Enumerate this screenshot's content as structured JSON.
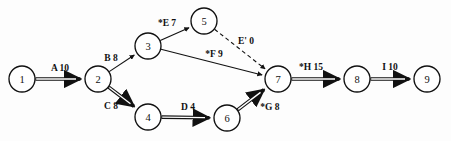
{
  "diagram": {
    "type": "activity-on-arrow-network",
    "title": "",
    "background_color": "#fdfdfd",
    "ink_color": "#111111",
    "nodes": [
      {
        "id": "1",
        "label": "1",
        "cx": 22,
        "cy": 79,
        "r": 13
      },
      {
        "id": "2",
        "label": "2",
        "cx": 98,
        "cy": 79,
        "r": 13
      },
      {
        "id": "3",
        "label": "3",
        "cx": 148,
        "cy": 46,
        "r": 13
      },
      {
        "id": "4",
        "label": "4",
        "cx": 148,
        "cy": 117,
        "r": 13
      },
      {
        "id": "5",
        "label": "5",
        "cx": 204,
        "cy": 21,
        "r": 13
      },
      {
        "id": "6",
        "label": "6",
        "cx": 227,
        "cy": 118,
        "r": 13
      },
      {
        "id": "7",
        "label": "7",
        "cx": 278,
        "cy": 79,
        "r": 13
      },
      {
        "id": "8",
        "label": "8",
        "cx": 357,
        "cy": 79,
        "r": 13
      },
      {
        "id": "9",
        "label": "9",
        "cx": 427,
        "cy": 79,
        "r": 13
      }
    ],
    "edges": [
      {
        "id": "A",
        "from": "1",
        "to": "2",
        "activity": "A",
        "duration": "10",
        "label": "A 10",
        "style": "double",
        "critical": true,
        "label_x": 60,
        "label_y": 68
      },
      {
        "id": "B",
        "from": "2",
        "to": "3",
        "activity": "B",
        "duration": "8",
        "label": "B 8",
        "style": "single",
        "critical": false,
        "label_x": 111,
        "label_y": 58
      },
      {
        "id": "C",
        "from": "2",
        "to": "4",
        "activity": "C",
        "duration": "8",
        "label": "C 8",
        "style": "double",
        "critical": true,
        "label_x": 111,
        "label_y": 106
      },
      {
        "id": "E",
        "from": "3",
        "to": "5",
        "activity": "*E",
        "duration": "7",
        "label": "*E 7",
        "style": "single",
        "critical": false,
        "label_x": 167,
        "label_y": 23
      },
      {
        "id": "F",
        "from": "3",
        "to": "7",
        "activity": "*F",
        "duration": "9",
        "label": "*F 9",
        "style": "single",
        "critical": false,
        "label_x": 214,
        "label_y": 54
      },
      {
        "id": "D",
        "from": "4",
        "to": "6",
        "activity": "D",
        "duration": "4",
        "label": "D 4",
        "style": "double",
        "critical": true,
        "label_x": 188,
        "label_y": 107
      },
      {
        "id": "Ep",
        "from": "5",
        "to": "7",
        "activity": "E'",
        "duration": "0",
        "label": "E' 0",
        "style": "dashed",
        "critical": false,
        "label_x": 246,
        "label_y": 41
      },
      {
        "id": "G",
        "from": "6",
        "to": "7",
        "activity": "*G",
        "duration": "8",
        "label": "*G 8",
        "style": "double",
        "critical": true,
        "label_x": 270,
        "label_y": 107
      },
      {
        "id": "H",
        "from": "7",
        "to": "8",
        "activity": "*H",
        "duration": "15",
        "label": "*H 15",
        "style": "double",
        "critical": true,
        "label_x": 311,
        "label_y": 67
      },
      {
        "id": "I",
        "from": "8",
        "to": "9",
        "activity": "I",
        "duration": "10",
        "label": "I 10",
        "style": "double",
        "critical": true,
        "label_x": 390,
        "label_y": 67
      }
    ]
  }
}
